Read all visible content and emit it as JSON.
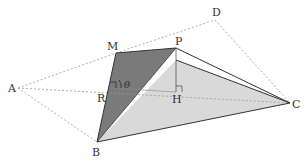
{
  "diagram": {
    "type": "3d-geometry-figure",
    "labels": {
      "A": "A",
      "B": "B",
      "C": "C",
      "D": "D",
      "M": "M",
      "P": "P",
      "R": "R",
      "H": "H",
      "theta": "θ"
    },
    "colors": {
      "dark_face": "#7a7a7a",
      "light_face": "#d9d9d9",
      "edge": "#333333",
      "dashed": "#999999",
      "background": "#ffffff"
    },
    "solid_edges": [
      "M-B",
      "M-P",
      "P-C",
      "B-C",
      "P-H",
      "B-P",
      "Q-C"
    ],
    "dashed_edges": [
      "A-M",
      "M-D",
      "D-C",
      "A-B",
      "A-C"
    ],
    "right_angles": [
      "R",
      "H"
    ],
    "angle_marked": "theta at R"
  }
}
